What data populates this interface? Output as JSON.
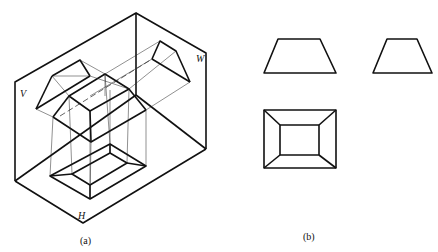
{
  "figure": {
    "part_a": {
      "caption": "(a)",
      "plane_labels": {
        "v": "V",
        "w": "W",
        "h": "H"
      },
      "description": "Three-projection-plane box with a frustum (truncated rectangular pyramid) projected onto V, W and H planes"
    },
    "part_b": {
      "caption": "(b)",
      "views": [
        "front-view-trapezoid",
        "side-view-trapezoid",
        "top-view-nested-rectangles"
      ]
    }
  }
}
